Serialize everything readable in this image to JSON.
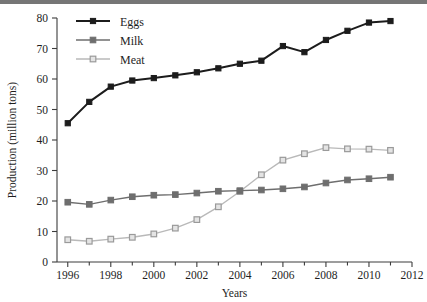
{
  "chart_data": {
    "type": "line",
    "title": "",
    "xlabel": "Years",
    "ylabel": "Production (million tons)",
    "xlim": [
      1995.5,
      2012
    ],
    "ylim": [
      0,
      80
    ],
    "xticks": [
      1996,
      1998,
      2000,
      2002,
      2004,
      2006,
      2008,
      2010,
      2012
    ],
    "xtick_labels": [
      "1996",
      "1998",
      "2000",
      "2002",
      "2004",
      "2006",
      "2008",
      "2010",
      "2012"
    ],
    "xminor_ticks": [
      1997,
      1999,
      2001,
      2003,
      2005,
      2007,
      2009,
      2011
    ],
    "yticks": [
      0,
      10,
      20,
      30,
      40,
      50,
      60,
      70,
      80
    ],
    "ytick_labels": [
      "0",
      "10",
      "20",
      "30",
      "40",
      "50",
      "60",
      "70",
      "80"
    ],
    "grid": false,
    "legend_position": "upper-left-inside",
    "x": [
      1996,
      1997,
      1998,
      1999,
      2000,
      2001,
      2002,
      2003,
      2004,
      2005,
      2006,
      2007,
      2008,
      2009,
      2010,
      2011
    ],
    "series": [
      {
        "name": "Eggs",
        "color": "#1c1c1c",
        "marker": "filled-square",
        "values": [
          45.5,
          52.5,
          57.5,
          59.5,
          60.3,
          61.2,
          62.2,
          63.5,
          65.0,
          66.0,
          70.8,
          68.8,
          72.8,
          75.8,
          78.5,
          79.0
        ]
      },
      {
        "name": "Milk",
        "color": "#6e6e6e",
        "marker": "filled-square",
        "values": [
          19.6,
          18.9,
          20.3,
          21.4,
          21.9,
          22.1,
          22.6,
          23.2,
          23.4,
          23.6,
          24.0,
          24.6,
          25.9,
          26.9,
          27.3,
          27.8
        ]
      },
      {
        "name": "Meat",
        "color": "#b9b9b9",
        "marker": "open-square",
        "values": [
          7.3,
          6.8,
          7.5,
          8.1,
          9.2,
          11.1,
          13.9,
          18.1,
          23.1,
          28.6,
          33.4,
          35.5,
          37.5,
          37.1,
          37.0,
          36.6
        ]
      }
    ],
    "legend": [
      {
        "label": "Eggs",
        "color": "#1c1c1c",
        "marker": "filled-square"
      },
      {
        "label": "Milk",
        "color": "#6e6e6e",
        "marker": "filled-square"
      },
      {
        "label": "Meat",
        "color": "#b9b9b9",
        "marker": "open-square"
      }
    ]
  }
}
